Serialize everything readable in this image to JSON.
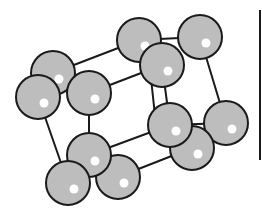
{
  "diagram": {
    "title": "",
    "colors": {
      "atom_fill": "#bdbdbd",
      "atom_stroke": "#1a1a1a",
      "highlight": "#ffffff",
      "bond": "#1a1a1a",
      "background": "#ffffff"
    },
    "atoms": [
      {
        "id": "A"
      },
      {
        "id": "B"
      },
      {
        "id": "C"
      },
      {
        "id": "D"
      },
      {
        "id": "E"
      },
      {
        "id": "F"
      },
      {
        "id": "G"
      },
      {
        "id": "H"
      },
      {
        "id": "I"
      },
      {
        "id": "J"
      },
      {
        "id": "K"
      },
      {
        "id": "L"
      }
    ],
    "bonds": [
      [
        "A",
        "D"
      ],
      [
        "C",
        "E"
      ],
      [
        "D",
        "F"
      ],
      [
        "F",
        "H"
      ],
      [
        "E",
        "G"
      ],
      [
        "G",
        "H"
      ],
      [
        "G",
        "J"
      ],
      [
        "I",
        "L"
      ],
      [
        "B",
        "K"
      ],
      [
        "C",
        "J"
      ],
      [
        "H",
        "I"
      ],
      [
        "A",
        "B"
      ]
    ]
  }
}
